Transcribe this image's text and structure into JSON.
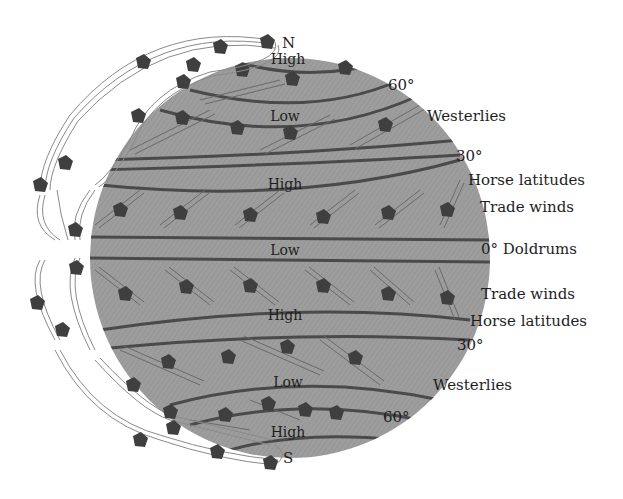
{
  "diagram": {
    "colors": {
      "globe_fill": "#9a9a9a",
      "band_line": "#4a4a4a",
      "arrow": "#3f3f3f",
      "cell_stroke": "#8a8a8a",
      "background": "#ffffff",
      "text": "#1e1e1e"
    },
    "poles": {
      "north": "N",
      "south": "S"
    },
    "pressure_bands": [
      {
        "id": "north-polar-high",
        "label": "High"
      },
      {
        "id": "north-subpolar-low",
        "label": "Low"
      },
      {
        "id": "north-subtropical-high",
        "label": "High"
      },
      {
        "id": "equatorial-low",
        "label": "Low"
      },
      {
        "id": "south-subtropical-high",
        "label": "High"
      },
      {
        "id": "south-subpolar-low",
        "label": "Low"
      },
      {
        "id": "south-polar-high",
        "label": "High"
      }
    ],
    "right_labels": {
      "lat_60_north": "60°",
      "westerlies_north": "Westerlies",
      "lat_30_north": "30°",
      "horse_latitudes_north": "Horse latitudes",
      "trade_winds_north": "Trade winds",
      "doldrums": "0° Doldrums",
      "trade_winds_south": "Trade winds",
      "horse_latitudes_south": "Horse latitudes",
      "lat_30_south": "30°",
      "westerlies_south": "Westerlies",
      "lat_60_south": "60°"
    }
  }
}
